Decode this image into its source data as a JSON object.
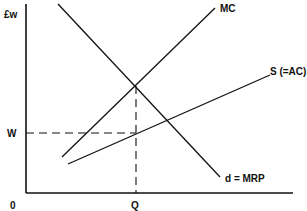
{
  "diagram": {
    "type": "economics-monopsony-labour-market",
    "y_axis_label": "£w",
    "x_axis_origin": "0",
    "wage_label": "W",
    "quantity_label": "Q",
    "curves": [
      {
        "name": "MC",
        "label": "MC"
      },
      {
        "name": "supply",
        "label": "S (=AC)"
      },
      {
        "name": "demand",
        "label": "d = MRP"
      }
    ],
    "colors": {
      "line": "#111111",
      "background": "#ffffff"
    }
  }
}
